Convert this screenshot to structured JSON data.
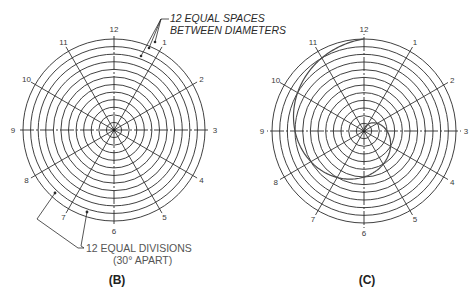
{
  "figure_b": {
    "caption": "(B)",
    "center": [
      114,
      130
    ],
    "outer_radius": 91,
    "ring_count": 12,
    "clock_labels": [
      "12",
      "1",
      "2",
      "3",
      "4",
      "5",
      "6",
      "7",
      "8",
      "9",
      "10",
      "11"
    ],
    "note_top_line1": "12 EQUAL SPACES",
    "note_top_line2": "BETWEEN DIAMETERS",
    "note_bottom_line1": "12 EQUAL DIVISIONS",
    "note_bottom_line2": "(30° APART)"
  },
  "figure_c": {
    "caption": "(C)",
    "center": [
      364,
      131
    ],
    "outer_radius": 92,
    "ring_count": 12,
    "clock_labels": [
      "12",
      "1",
      "2",
      "3",
      "4",
      "5",
      "6",
      "7",
      "8",
      "9",
      "10",
      "11"
    ],
    "curve": "archimedean-spiral"
  },
  "colors": {
    "line": "#2b2b2b",
    "text": "#3a3a3a",
    "background": "#ffffff"
  }
}
